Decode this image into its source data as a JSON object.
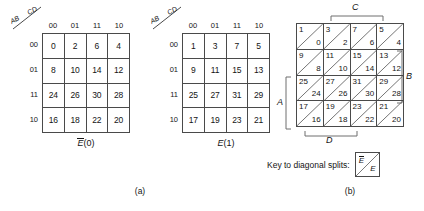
{
  "figure": {
    "parts": [
      {
        "label": "(a)"
      },
      {
        "label": "(b)"
      }
    ]
  },
  "kmaps": [
    {
      "id": "kmap-e0",
      "axis_row_label": "AB",
      "axis_col_label": "CD",
      "col_headers": [
        "00",
        "01",
        "11",
        "10"
      ],
      "row_headers": [
        "00",
        "01",
        "11",
        "10"
      ],
      "caption_var": "E",
      "caption_overbar": true,
      "caption_value": "(0)",
      "rows": [
        [
          "0",
          "2",
          "6",
          "4"
        ],
        [
          "8",
          "10",
          "14",
          "12"
        ],
        [
          "24",
          "26",
          "30",
          "28"
        ],
        [
          "16",
          "18",
          "22",
          "20"
        ]
      ]
    },
    {
      "id": "kmap-e1",
      "axis_row_label": "AB",
      "axis_col_label": "CD",
      "col_headers": [
        "00",
        "01",
        "11",
        "10"
      ],
      "row_headers": [
        "00",
        "01",
        "11",
        "10"
      ],
      "caption_var": "E",
      "caption_overbar": false,
      "caption_value": "(1)",
      "rows": [
        [
          "1",
          "3",
          "7",
          "5"
        ],
        [
          "9",
          "11",
          "15",
          "13"
        ],
        [
          "25",
          "27",
          "31",
          "29"
        ],
        [
          "17",
          "19",
          "23",
          "21"
        ]
      ]
    }
  ],
  "diagonal_map": {
    "id": "diagonal-split-map",
    "cells_odd": [
      [
        "1",
        "3",
        "7",
        "5"
      ],
      [
        "9",
        "11",
        "15",
        "13"
      ],
      [
        "25",
        "27",
        "31",
        "29"
      ],
      [
        "17",
        "19",
        "23",
        "21"
      ]
    ],
    "cells_even": [
      [
        "0",
        "2",
        "6",
        "4"
      ],
      [
        "8",
        "10",
        "14",
        "12"
      ],
      [
        "24",
        "26",
        "30",
        "28"
      ],
      [
        "16",
        "18",
        "22",
        "20"
      ]
    ],
    "brackets": {
      "top": "C",
      "right": "B",
      "left": "A",
      "bottom": "D"
    }
  },
  "key": {
    "text": "Key to diagonal splits:",
    "top_var": "E",
    "top_overbar": true,
    "bottom_var": "E",
    "bottom_overbar": false
  }
}
